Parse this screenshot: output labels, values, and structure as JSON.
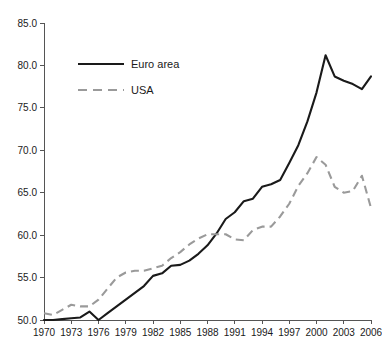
{
  "chart_data": {
    "type": "line",
    "title": "",
    "xlabel": "",
    "ylabel": "",
    "xlim": [
      1970,
      2006
    ],
    "ylim": [
      50.0,
      85.0
    ],
    "grid": false,
    "legend_position": "top-left",
    "x": [
      1970,
      1971,
      1972,
      1973,
      1974,
      1975,
      1976,
      1977,
      1978,
      1979,
      1980,
      1981,
      1982,
      1983,
      1984,
      1985,
      1986,
      1987,
      1988,
      1989,
      1990,
      1991,
      1992,
      1993,
      1994,
      1995,
      1996,
      1997,
      1998,
      1999,
      2000,
      2001,
      2002,
      2003,
      2004,
      2005,
      2006
    ],
    "xticks": [
      1970,
      1973,
      1976,
      1979,
      1982,
      1985,
      1988,
      1991,
      1994,
      1997,
      2000,
      2003,
      2006
    ],
    "xtick_labels": [
      "1970",
      "1973",
      "1976",
      "1979",
      "1982",
      "1985",
      "1988",
      "1991",
      "1994",
      "1997",
      "2000",
      "2003",
      "2006"
    ],
    "yticks": [
      50.0,
      55.0,
      60.0,
      65.0,
      70.0,
      75.0,
      80.0,
      85.0
    ],
    "ytick_labels": [
      "50.0",
      "55.0",
      "60.0",
      "65.0",
      "70.0",
      "75.0",
      "80.0",
      "85.0"
    ],
    "series": [
      {
        "name": "Euro area",
        "color": "#1a1a1a",
        "style": "solid",
        "values": [
          50.0,
          50.0,
          50.1,
          50.2,
          50.3,
          51.0,
          50.0,
          50.8,
          51.6,
          52.4,
          53.2,
          54.0,
          55.2,
          55.5,
          56.4,
          56.5,
          57.0,
          57.8,
          58.8,
          60.2,
          61.9,
          62.7,
          64.0,
          64.3,
          65.7,
          66.0,
          66.5,
          68.5,
          70.6,
          73.4,
          76.8,
          81.2,
          78.7,
          78.2,
          77.8,
          77.2,
          78.7
        ]
      },
      {
        "name": "USA",
        "color": "#9a9a9a",
        "style": "dashed",
        "values": [
          50.8,
          50.6,
          51.2,
          51.8,
          51.6,
          51.6,
          52.4,
          53.7,
          55.0,
          55.6,
          55.8,
          55.8,
          56.1,
          56.4,
          57.3,
          58.0,
          58.9,
          59.6,
          60.1,
          60.1,
          60.1,
          59.5,
          59.4,
          60.6,
          61.0,
          61.0,
          62.2,
          63.7,
          65.8,
          67.3,
          69.2,
          68.3,
          65.7,
          65.0,
          65.2,
          67.0,
          63.2
        ]
      }
    ]
  },
  "legend": {
    "entries": [
      {
        "label": "Euro area",
        "color": "#1a1a1a",
        "style": "solid"
      },
      {
        "label": "USA",
        "color": "#9a9a9a",
        "style": "dashed"
      }
    ]
  }
}
